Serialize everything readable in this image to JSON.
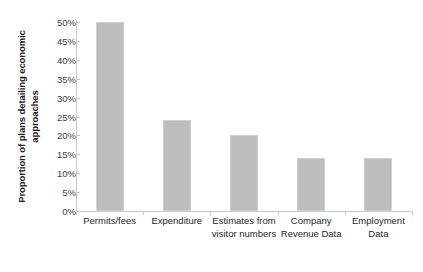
{
  "chart_data": {
    "type": "bar",
    "title": "",
    "xlabel": "",
    "ylabel": "Proportion of plans detailing economic approaches",
    "categories": [
      "Permits/fees",
      "Expenditure",
      "Estimates from visitor numbers",
      "Company Revenue Data",
      "Employment Data"
    ],
    "values": [
      50,
      24,
      20,
      14,
      14
    ],
    "value_labels": [
      "50%",
      "24%",
      "20%",
      "14%",
      "14%"
    ],
    "ylim": [
      0,
      50
    ],
    "ytick_values": [
      50,
      45,
      40,
      35,
      30,
      25,
      20,
      15,
      10,
      5,
      0
    ],
    "ytick_labels": [
      "50%",
      "45%",
      "40%",
      "35%",
      "30%",
      "25%",
      "20%",
      "15%",
      "10%",
      "5%",
      "0%"
    ],
    "grid": false,
    "legend": null,
    "bar_color": "#bdbdbd",
    "bar_border_color": "#cfcfcf",
    "axis_color": "#c9c9c9",
    "text_color": "#262626"
  }
}
